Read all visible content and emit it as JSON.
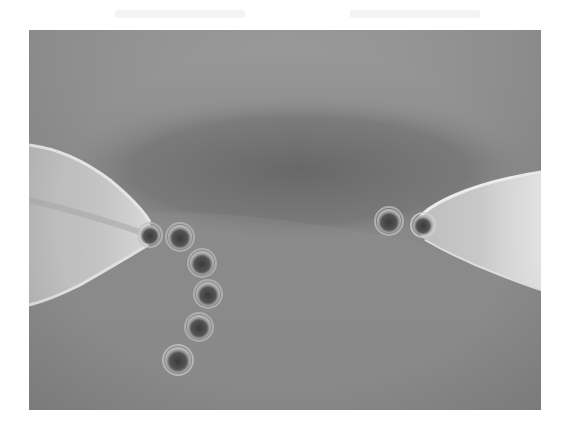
{
  "figure": {
    "frame": {
      "x": 29,
      "y": 30,
      "width": 512,
      "height": 380
    },
    "colors": {
      "background": "#8c8c8c",
      "dark_band": "#6f6f6f",
      "pipette": "#c9c9c9",
      "bead_core": "#3e3e3e",
      "bead_halo": "#b5b5b5",
      "page": "#ffffff"
    },
    "pipettes": [
      {
        "side": "left",
        "tip": [
          148,
          230
        ]
      },
      {
        "side": "right",
        "tip": [
          418,
          225
        ]
      }
    ],
    "beads": [
      {
        "cx": 150,
        "cy": 235,
        "r": 10
      },
      {
        "cx": 180,
        "cy": 237,
        "r": 12
      },
      {
        "cx": 202,
        "cy": 263,
        "r": 12
      },
      {
        "cx": 208,
        "cy": 294,
        "r": 12
      },
      {
        "cx": 199,
        "cy": 327,
        "r": 12
      },
      {
        "cx": 178,
        "cy": 360,
        "r": 13
      },
      {
        "cx": 389,
        "cy": 221,
        "r": 12
      },
      {
        "cx": 423,
        "cy": 225,
        "r": 10
      }
    ]
  }
}
